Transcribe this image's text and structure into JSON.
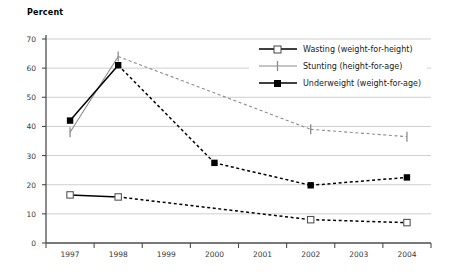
{
  "chart_data": {
    "type": "line",
    "title": "",
    "xlabel": "",
    "ylabel": "Percent",
    "ylim": [
      0,
      70
    ],
    "ytick_step": 10,
    "yticks": [
      0,
      10,
      20,
      30,
      40,
      50,
      60,
      70
    ],
    "categories": [
      "1997",
      "1998",
      "1999",
      "2000",
      "2001",
      "2002",
      "2003",
      "2004"
    ],
    "grid": "horizontal",
    "legend_position": "upper-right",
    "series": [
      {
        "name": "Wasting (weight-for-height)",
        "marker": "open-square",
        "color": "#000000",
        "x": [
          "1997",
          "1998",
          "2002",
          "2004"
        ],
        "values": [
          16.5,
          15.8,
          8.0,
          7.0
        ]
      },
      {
        "name": "Stunting (height-for-age)",
        "marker": "vertical-tick",
        "color": "#8c8c8c",
        "x": [
          "1997",
          "1998",
          "2002",
          "2004"
        ],
        "values": [
          38.0,
          64.0,
          39.0,
          36.5
        ]
      },
      {
        "name": "Underweight (weight-for-age)",
        "marker": "filled-square",
        "color": "#000000",
        "x": [
          "1997",
          "1998",
          "2000",
          "2002",
          "2004"
        ],
        "values": [
          42.0,
          61.0,
          27.5,
          19.8,
          22.5
        ]
      }
    ]
  },
  "axis": {
    "y_title": "Percent",
    "y_tick_labels": [
      "70",
      "60",
      "50",
      "40",
      "30",
      "20",
      "10",
      "0"
    ],
    "x_tick_labels": [
      "1997",
      "1998",
      "1999",
      "2000",
      "2001",
      "2002",
      "2003",
      "2004"
    ]
  },
  "legend": {
    "items": [
      {
        "label": "Wasting (weight-for-height)",
        "marker": "open-square-icon"
      },
      {
        "label": "Stunting (height-for-age)",
        "marker": "vertical-tick-icon"
      },
      {
        "label": "Underweight (weight-for-age)",
        "marker": "filled-square-icon"
      }
    ]
  },
  "colors": {
    "grid": "#c9c9c9",
    "axis": "#4d4d4d",
    "stunting": "#8c8c8c",
    "underweight": "#000000",
    "wasting": "#000000",
    "text": "#3a3a3a"
  }
}
